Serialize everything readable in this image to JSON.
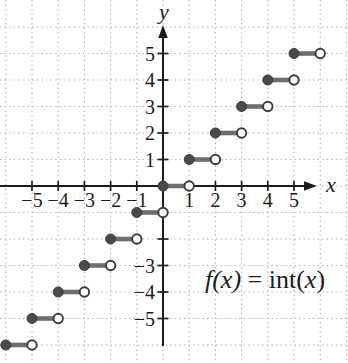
{
  "chart_data": {
    "type": "line",
    "subtype": "step-function",
    "title": "",
    "function_label": "f(x) = int(x)",
    "annotation": {
      "p1": "f(x)",
      "p2": " = int(",
      "p3": "x",
      "p4": ")"
    },
    "xlabel": "x",
    "ylabel": "y",
    "xlim": [
      -6.2,
      7.0
    ],
    "ylim": [
      -6.7,
      6.1
    ],
    "grid": true,
    "grid_step": 1,
    "x_ticks": [
      -5,
      -4,
      -3,
      -2,
      -1,
      1,
      2,
      3,
      4,
      5
    ],
    "x_tick_labels": [
      "−5",
      "−4",
      "−3",
      "−2",
      "−1",
      "1",
      "2",
      "3",
      "4",
      "5"
    ],
    "y_ticks": [
      -5,
      -4,
      -3,
      -2,
      -1,
      1,
      2,
      3,
      4,
      5
    ],
    "y_tick_labels": [
      "−5",
      "−4",
      "−3",
      "",
      "",
      "1",
      "2",
      "3",
      "4",
      "5"
    ],
    "endpoint_style": {
      "left": "closed-dot",
      "right": "open-circle"
    },
    "segments": [
      {
        "y": -6,
        "x_start": -6,
        "x_end": -5
      },
      {
        "y": -5,
        "x_start": -5,
        "x_end": -4
      },
      {
        "y": -4,
        "x_start": -4,
        "x_end": -3
      },
      {
        "y": -3,
        "x_start": -3,
        "x_end": -2
      },
      {
        "y": -2,
        "x_start": -2,
        "x_end": -1
      },
      {
        "y": -1,
        "x_start": -1,
        "x_end": 0
      },
      {
        "y": 0,
        "x_start": 0,
        "x_end": 1
      },
      {
        "y": 1,
        "x_start": 1,
        "x_end": 2
      },
      {
        "y": 2,
        "x_start": 2,
        "x_end": 3
      },
      {
        "y": 3,
        "x_start": 3,
        "x_end": 4
      },
      {
        "y": 4,
        "x_start": 4,
        "x_end": 5
      },
      {
        "y": 5,
        "x_start": 5,
        "x_end": 6
      }
    ]
  },
  "colors": {
    "background": "#ffffff",
    "axis": "#1c1c1c",
    "grid": "#b4b4b4",
    "segment_line": "#6e6e6e",
    "dot_fill": "#4a4a4a",
    "dot_stroke": "#3a3a3a",
    "open_fill": "#ffffff",
    "open_stroke": "#3a3a3a",
    "label": "#1c1c1c"
  }
}
